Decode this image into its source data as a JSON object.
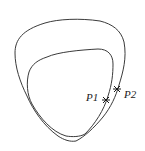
{
  "diagram": {
    "curves": [
      {
        "name": "outer",
        "color": "#3a3a3a"
      },
      {
        "name": "inner",
        "color": "#3a3a3a"
      }
    ],
    "points": [
      {
        "label": "P1",
        "x": 106,
        "y": 100
      },
      {
        "label": "P2",
        "x": 117,
        "y": 89
      }
    ]
  }
}
